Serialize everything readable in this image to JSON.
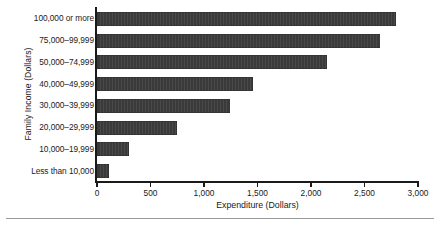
{
  "chart_data": {
    "type": "bar",
    "orientation": "horizontal",
    "title": "",
    "xlabel": "Expenditure (Dollars)",
    "ylabel": "Family Income (Dollars)",
    "categories": [
      "100,000 or more",
      "75,000–99,999",
      "50,000–74,999",
      "40,000–49,999",
      "30,000–39,999",
      "20,000–29,999",
      "10,000–19,999",
      "Less than 10,000"
    ],
    "values": [
      2790,
      2645,
      2150,
      1460,
      1245,
      750,
      300,
      115
    ],
    "xlim": [
      0,
      3000
    ],
    "xticks": [
      0,
      500,
      1000,
      1500,
      2000,
      2500,
      3000
    ],
    "xtick_labels": [
      "0",
      "500",
      "1,000",
      "1,500",
      "2,000",
      "2,500",
      "3,000"
    ],
    "grid": false,
    "legend": false,
    "bar_color": "#3a3a3a",
    "axis_color": "#1a1a1a",
    "background": "#ffffff"
  }
}
